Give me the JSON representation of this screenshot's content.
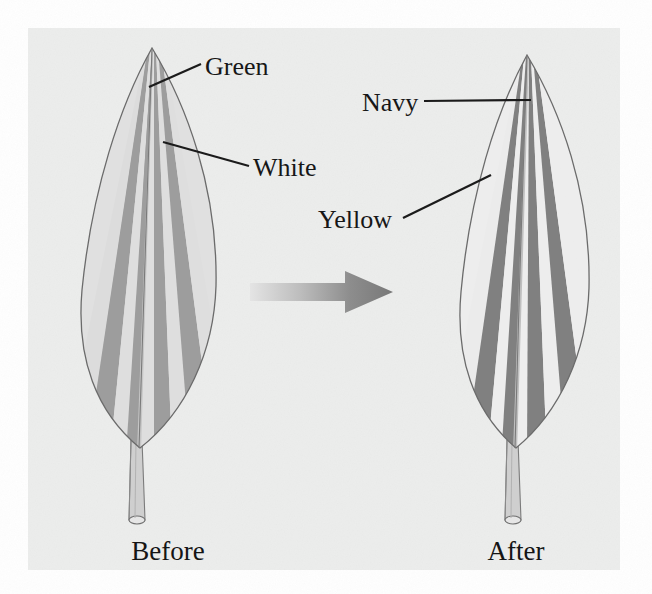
{
  "figure": {
    "background_page_color": "#ffffff",
    "panel_color": "#ececed",
    "panel": {
      "x": 28,
      "y": 28,
      "width": 592,
      "height": 542
    }
  },
  "arrow": {
    "name": "transition-arrow",
    "direction": "right",
    "gradient_from": "#e2e2e2",
    "gradient_to": "#7b7b7b"
  },
  "leaves": [
    {
      "id": "before",
      "caption": "Before",
      "caption_pos": {
        "x": 168,
        "y": 558
      },
      "tip": {
        "x": 152,
        "y": 48
      },
      "base": {
        "x": 140,
        "y": 448
      },
      "stem_tip": {
        "x": 137,
        "y": 527
      },
      "stripe_colors": [
        "#9a9a9a",
        "#dcdcdc"
      ],
      "stripes": [
        {
          "name": "green-stripe",
          "color": "#9a9a9a"
        },
        {
          "name": "white-stripe",
          "color": "#dedede"
        },
        {
          "name": "green-stripe",
          "color": "#9a9a9a"
        },
        {
          "name": "white-stripe",
          "color": "#dedede"
        },
        {
          "name": "green-stripe",
          "color": "#9a9a9a"
        },
        {
          "name": "white-stripe",
          "color": "#dedede"
        },
        {
          "name": "green-stripe",
          "color": "#9a9a9a"
        }
      ],
      "labels": [
        {
          "text": "Green",
          "name": "label-green",
          "text_pos": {
            "x": 205,
            "y": 75
          },
          "leader": {
            "x1": 149,
            "y1": 87,
            "x2": 201,
            "y2": 64
          }
        },
        {
          "text": "White",
          "name": "label-white",
          "text_pos": {
            "x": 253,
            "y": 172
          },
          "leader": {
            "x1": 163,
            "y1": 142,
            "x2": 249,
            "y2": 166
          }
        }
      ]
    },
    {
      "id": "after",
      "caption": "After",
      "caption_pos": {
        "x": 500,
        "y": 558
      },
      "tip": {
        "x": 527,
        "y": 55
      },
      "base": {
        "x": 516,
        "y": 448
      },
      "stem_tip": {
        "x": 513,
        "y": 527
      },
      "stripe_colors": [
        "#7e7e7e",
        "#e9e9e9"
      ],
      "stripes": [
        {
          "name": "navy-stripe",
          "color": "#7e7e7e"
        },
        {
          "name": "yellow-stripe",
          "color": "#ececec"
        },
        {
          "name": "navy-stripe",
          "color": "#7e7e7e"
        },
        {
          "name": "yellow-stripe",
          "color": "#ececec"
        },
        {
          "name": "navy-stripe",
          "color": "#7e7e7e"
        },
        {
          "name": "yellow-stripe",
          "color": "#ececec"
        },
        {
          "name": "navy-stripe",
          "color": "#7e7e7e"
        }
      ],
      "labels": [
        {
          "text": "Navy",
          "name": "label-navy",
          "text_pos": {
            "x": 365,
            "y": 110
          },
          "leader": {
            "x1": 424,
            "y1": 101,
            "x2": 531,
            "y2": 100
          }
        },
        {
          "text": "Yellow",
          "name": "label-yellow",
          "text_pos": {
            "x": 322,
            "y": 222
          },
          "leader": {
            "x1": 403,
            "y1": 218,
            "x2": 491,
            "y2": 175
          }
        }
      ]
    }
  ]
}
